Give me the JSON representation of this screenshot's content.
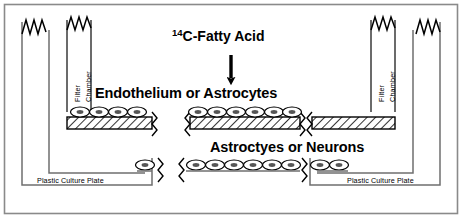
{
  "figure": {
    "title_tracer_sup": "14",
    "title_tracer_main": "C-Fatty Acid",
    "label_upper_cells": "Endothelium or Astrocytes",
    "label_lower_cells": "Astroctyes or Neurons",
    "chamber_line1": "Filter",
    "chamber_line2": "Chamber",
    "plate_label_left": "Plastic Culture Plate",
    "plate_label_right": "Plastic Culture Plate",
    "colors": {
      "ink": "#000000",
      "background": "#ffffff",
      "frame": "#8a8a8a",
      "membrane_fill": "#ffffff",
      "cell_fill": "#ffffff",
      "nucleus_fill": "#555555"
    },
    "elements": {
      "arrow_name": "downward-arrow-tracer-flux",
      "break_mark_name": "zigzag-break-mark",
      "membrane_name": "hatched-filter-membrane",
      "cell_name": "cell-monolayer"
    },
    "counts": {
      "filter_chambers": 2,
      "culture_plates": 2,
      "upper_cell_segments": 2,
      "lower_cell_segments": 3,
      "membrane_segments": 3
    }
  }
}
